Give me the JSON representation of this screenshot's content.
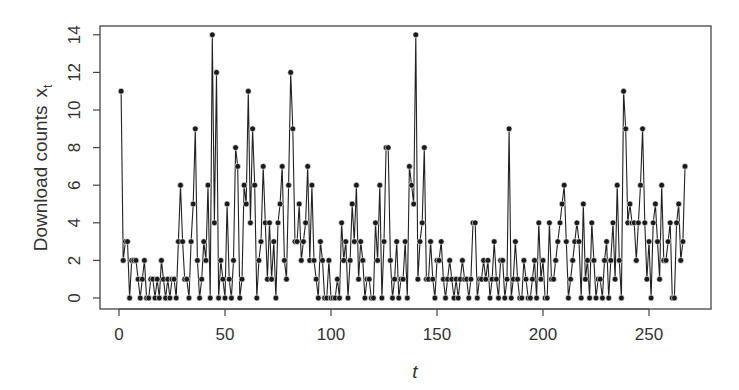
{
  "chart_data": {
    "type": "line",
    "title": "",
    "xlabel": "t",
    "ylabel": "Download counts",
    "ylabel_subscript_var": "x",
    "ylabel_subscript": "t",
    "xlim": [
      0,
      267
    ],
    "ylim": [
      0,
      14
    ],
    "x_ticks": [
      0,
      50,
      100,
      150,
      200,
      250
    ],
    "y_ticks": [
      0,
      2,
      4,
      6,
      8,
      10,
      12,
      14
    ],
    "grid": false,
    "legend": null,
    "style": {
      "line_color": "#222222",
      "point_color": "#1a1a1a",
      "markers": "filled-circle"
    },
    "x_start": 1,
    "values": [
      11,
      2,
      3,
      3,
      0,
      2,
      2,
      2,
      1,
      0,
      1,
      2,
      0,
      0,
      1,
      1,
      0,
      1,
      0,
      2,
      1,
      0,
      1,
      0,
      1,
      1,
      0,
      3,
      6,
      3,
      1,
      1,
      0,
      3,
      5,
      9,
      2,
      0,
      1,
      3,
      2,
      6,
      0,
      14,
      4,
      12,
      0,
      2,
      1,
      0,
      5,
      1,
      0,
      2,
      8,
      7,
      0,
      1,
      6,
      5,
      11,
      4,
      9,
      6,
      0,
      2,
      3,
      7,
      4,
      1,
      4,
      1,
      3,
      0,
      4,
      5,
      7,
      2,
      1,
      6,
      12,
      9,
      3,
      3,
      5,
      2,
      3,
      4,
      7,
      2,
      6,
      2,
      1,
      0,
      3,
      2,
      0,
      0,
      2,
      0,
      0,
      0,
      1,
      0,
      4,
      2,
      3,
      0,
      2,
      5,
      3,
      6,
      1,
      3,
      2,
      0,
      1,
      1,
      0,
      0,
      4,
      2,
      6,
      0,
      3,
      8,
      8,
      2,
      0,
      1,
      3,
      0,
      1,
      1,
      3,
      0,
      7,
      6,
      5,
      14,
      1,
      3,
      4,
      8,
      1,
      1,
      3,
      1,
      0,
      2,
      2,
      3,
      1,
      0,
      1,
      2,
      1,
      0,
      1,
      0,
      1,
      2,
      1,
      1,
      0,
      1,
      4,
      4,
      0,
      1,
      1,
      2,
      1,
      2,
      0,
      1,
      3,
      1,
      0,
      2,
      2,
      0,
      1,
      9,
      0,
      1,
      3,
      1,
      0,
      0,
      2,
      1,
      0,
      0,
      1,
      2,
      0,
      4,
      1,
      2,
      0,
      0,
      4,
      1,
      1,
      2,
      3,
      4,
      5,
      6,
      3,
      0,
      1,
      2,
      3,
      4,
      3,
      0,
      5,
      1,
      2,
      0,
      4,
      2,
      0,
      1,
      1,
      0,
      2,
      3,
      0,
      2,
      4,
      1,
      6,
      2,
      0,
      11,
      9,
      4,
      5,
      4,
      4,
      2,
      4,
      6,
      9,
      4,
      1,
      3,
      0,
      4,
      5,
      3,
      1,
      6,
      2,
      2,
      3,
      4,
      0,
      0,
      4,
      5,
      2,
      3,
      7
    ]
  },
  "labels": {
    "ylabel_main": "Download counts",
    "ylabel_var": "x",
    "ylabel_sub": "t",
    "xlabel": "t"
  }
}
